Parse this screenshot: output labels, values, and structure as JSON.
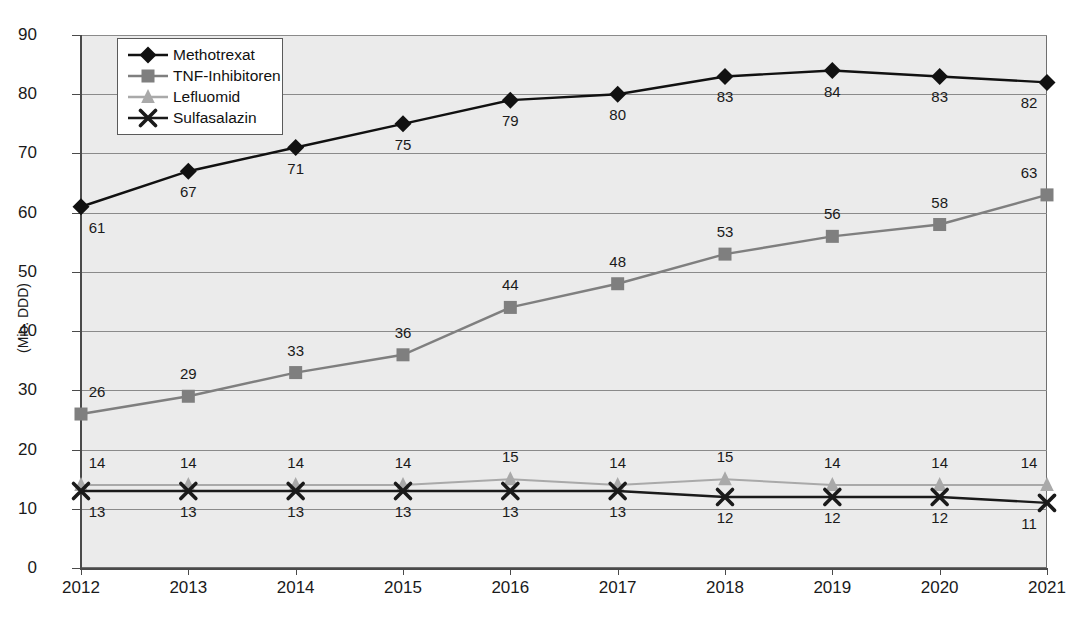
{
  "chart_data": {
    "type": "line",
    "title": "",
    "xlabel": "",
    "ylabel": "(Mio. DDD)",
    "ylim": [
      0,
      90
    ],
    "ytick_step": 10,
    "grid": true,
    "legend_position": "top-left",
    "categories": [
      "2012",
      "2013",
      "2014",
      "2015",
      "2016",
      "2017",
      "2018",
      "2019",
      "2020",
      "2021"
    ],
    "yticks": [
      "0",
      "10",
      "20",
      "30",
      "40",
      "50",
      "60",
      "70",
      "80",
      "90"
    ],
    "series": [
      {
        "name": "Methotrexat",
        "color": "#111111",
        "marker": "diamond",
        "label_position": "below",
        "values": [
          61,
          67,
          71,
          75,
          79,
          80,
          83,
          84,
          83,
          82
        ],
        "labels": [
          "61",
          "67",
          "71",
          "75",
          "79",
          "80",
          "83",
          "84",
          "83",
          "82"
        ]
      },
      {
        "name": "TNF-Inhibitoren",
        "color": "#7f7f7f",
        "marker": "square",
        "label_position": "above",
        "values": [
          26,
          29,
          33,
          36,
          44,
          48,
          53,
          56,
          58,
          63
        ],
        "labels": [
          "26",
          "29",
          "33",
          "36",
          "44",
          "48",
          "53",
          "56",
          "58",
          "63"
        ]
      },
      {
        "name": "Lefluomid",
        "color": "#a9a9a9",
        "marker": "triangle",
        "label_position": "above",
        "values": [
          14,
          14,
          14,
          14,
          15,
          14,
          15,
          14,
          14,
          14
        ],
        "labels": [
          "14",
          "14",
          "14",
          "14",
          "15",
          "14",
          "15",
          "14",
          "14",
          "14"
        ]
      },
      {
        "name": "Sulfasalazin",
        "color": "#1a1a1a",
        "marker": "cross",
        "label_position": "below",
        "values": [
          13,
          13,
          13,
          13,
          13,
          13,
          12,
          12,
          12,
          11
        ],
        "labels": [
          "13",
          "13",
          "13",
          "13",
          "13",
          "13",
          "12",
          "12",
          "12",
          "11"
        ]
      }
    ]
  },
  "legend": {
    "items": [
      {
        "label": "Methotrexat"
      },
      {
        "label": "TNF-Inhibitoren"
      },
      {
        "label": "Lefluomid"
      },
      {
        "label": "Sulfasalazin"
      }
    ]
  }
}
